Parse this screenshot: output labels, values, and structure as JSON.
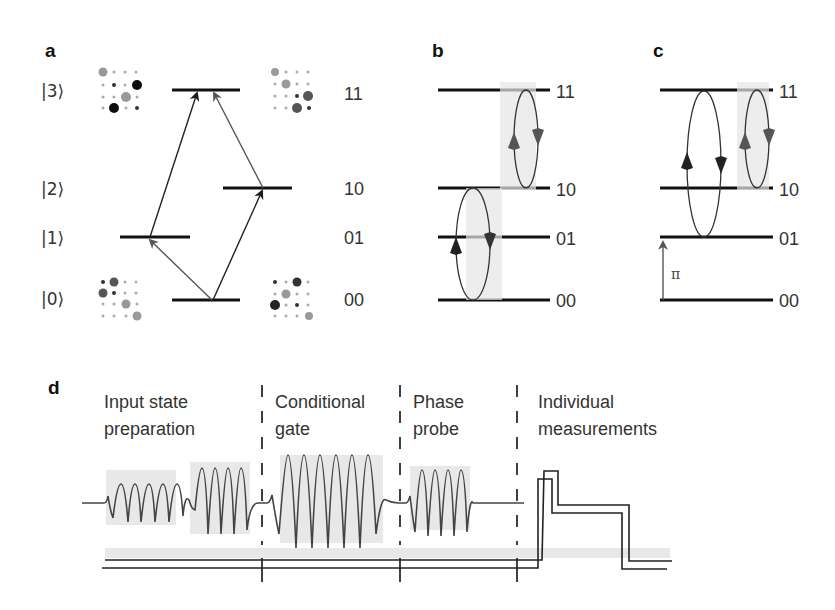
{
  "panels": {
    "a": {
      "label": "a",
      "kets": [
        "|0⟩",
        "|1⟩",
        "|2⟩",
        "|3⟩"
      ],
      "states": [
        "00",
        "01",
        "10",
        "11"
      ]
    },
    "b": {
      "label": "b",
      "states": [
        "00",
        "01",
        "10",
        "11"
      ]
    },
    "c": {
      "label": "c",
      "states": [
        "00",
        "01",
        "10",
        "11"
      ],
      "pulse_symbol": "π"
    },
    "d": {
      "label": "d",
      "phases": [
        {
          "line1": "Input state",
          "line2": "preparation"
        },
        {
          "line1": "Conditional",
          "line2": "gate"
        },
        {
          "line1": "Phase",
          "line2": "probe"
        },
        {
          "line1": "Individual",
          "line2": "measurements"
        }
      ]
    }
  },
  "colors": {
    "line": "#111111",
    "arrow_dark": "#1a1a1a",
    "arrow_grey": "#555555",
    "wave": "#444444",
    "shade": "#e6e6e6"
  }
}
